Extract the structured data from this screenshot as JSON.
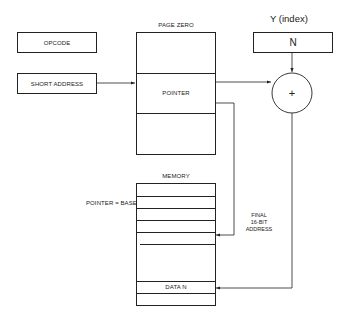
{
  "diagram": {
    "instruction": {
      "opcode_label": "OPCODE",
      "short_address_label": "SHORT ADDRESS"
    },
    "page_zero": {
      "label": "PAGE ZERO",
      "pointer_label": "POINTER"
    },
    "index_register": {
      "label": "Y (index)",
      "value": "N"
    },
    "adder": {
      "symbol": "+"
    },
    "memory": {
      "label": "MEMORY",
      "base_label": "POINTER = BASE",
      "data_label": "DATA N"
    },
    "final_address": {
      "line1": "FINAL",
      "line2": "16-BIT",
      "line3": "ADDRESS"
    },
    "colors": {
      "line": "#222222",
      "background": "#ffffff"
    }
  }
}
